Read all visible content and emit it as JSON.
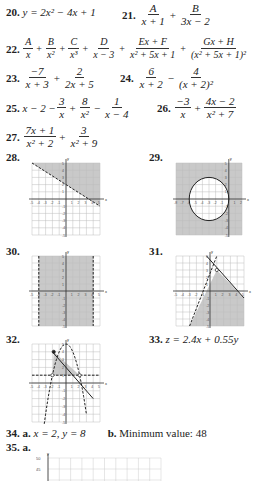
{
  "problems": {
    "p20": {
      "num": "20.",
      "expr": "y = 2x² − 4x + 1"
    },
    "p21": {
      "num": "21.",
      "t1n": "A",
      "t1d": "x + 1",
      "op": "+",
      "t2n": "B",
      "t2d": "3x − 2"
    },
    "p22": {
      "num": "22.",
      "terms": [
        {
          "n": "A",
          "d": "x"
        },
        {
          "n": "B",
          "d": "x²"
        },
        {
          "n": "C",
          "d": "x³"
        },
        {
          "n": "D",
          "d": "x − 3"
        },
        {
          "n": "Ex + F",
          "d": "x² + 5x + 1"
        },
        {
          "n": "Gx + H",
          "d": "(x² + 5x + 1)²"
        }
      ],
      "op": "+"
    },
    "p23": {
      "num": "23.",
      "t1n": "−7",
      "t1d": "x + 3",
      "op": "+",
      "t2n": "2",
      "t2d": "2x + 5"
    },
    "p24": {
      "num": "24.",
      "t1n": "6",
      "t1d": "x + 2",
      "op": "−",
      "t2n": "4",
      "t2d": "(x + 2)²"
    },
    "p25": {
      "num": "25.",
      "lead": "x − 2 −",
      "t1n": "3",
      "t1d": "x",
      "op1": "+",
      "t2n": "8",
      "t2d": "x²",
      "op2": "−",
      "t3n": "1",
      "t3d": "x − 4"
    },
    "p26": {
      "num": "26.",
      "t1n": "−3",
      "t1d": "x",
      "op": "+",
      "t2n": "4x − 2",
      "t2d": "x² + 7"
    },
    "p27": {
      "num": "27.",
      "t1n": "7x + 1",
      "t1d": "x² + 2",
      "op": "+",
      "t2n": "3",
      "t2d": "x² + 9"
    },
    "p28": {
      "num": "28."
    },
    "p29": {
      "num": "29."
    },
    "p30": {
      "num": "30."
    },
    "p31": {
      "num": "31."
    },
    "p32": {
      "num": "32."
    },
    "p33": {
      "num": "33.",
      "expr": "z = 2.4x + 0.55y"
    },
    "p34": {
      "num": "34.",
      "a_label": "a.",
      "a_text": "x = 2, y = 8",
      "b_label": "b.",
      "b_text": "Minimum value: 48"
    },
    "p35": {
      "num": "35.",
      "a_label": "a."
    }
  },
  "chart_data": [
    {
      "id": "graph-28",
      "type": "region",
      "xlim": [
        -5,
        5
      ],
      "ylim": [
        -5,
        5
      ],
      "boundary": [
        {
          "kind": "line",
          "from": [
            -5,
            5
          ],
          "to": [
            5,
            -1
          ],
          "style": "dashed"
        }
      ],
      "shaded": "above line",
      "axis_labels": {
        "x": "x",
        "y": "y"
      },
      "x_ticks": [
        -5,
        -4,
        -3,
        -2,
        -1,
        1,
        2,
        3,
        4,
        5
      ],
      "y_ticks": [
        -5,
        -4,
        -3,
        -2,
        -1,
        1,
        2,
        3,
        4,
        5
      ]
    },
    {
      "id": "graph-29",
      "type": "region",
      "xlim": [
        -8,
        2
      ],
      "ylim": [
        -5,
        5
      ],
      "boundary": [
        {
          "kind": "circle",
          "center": [
            -3,
            0
          ],
          "radius": 3,
          "style": "solid"
        }
      ],
      "shaded": "outside circle",
      "axis_labels": {
        "x": "x",
        "y": "y"
      },
      "x_ticks": [
        -8,
        -7,
        -6,
        -5,
        -4,
        -3,
        -2,
        -1,
        1,
        2
      ],
      "y_ticks": [
        -5,
        -4,
        -3,
        -2,
        -1,
        1,
        2,
        3,
        4,
        5
      ]
    },
    {
      "id": "graph-30",
      "type": "region",
      "xlim": [
        -5,
        5
      ],
      "ylim": [
        -5,
        5
      ],
      "boundary": [
        {
          "kind": "vline",
          "x": -4,
          "style": "dashed"
        },
        {
          "kind": "vline",
          "x": 4,
          "style": "dashed"
        }
      ],
      "shaded": "between lines",
      "axis_labels": {
        "x": "x",
        "y": "y"
      },
      "x_ticks": [
        -5,
        -4,
        -3,
        -2,
        -1,
        1,
        2,
        3,
        4,
        5
      ],
      "y_ticks": [
        -5,
        -4,
        -3,
        -2,
        -1,
        1,
        2,
        3,
        4,
        5
      ]
    },
    {
      "id": "graph-31",
      "type": "region",
      "xlim": [
        -5,
        5
      ],
      "ylim": [
        -5,
        5
      ],
      "boundary": [
        {
          "kind": "line",
          "from": [
            -3,
            -5
          ],
          "to": [
            1,
            5
          ],
          "style": "dashed"
        },
        {
          "kind": "line",
          "from": [
            -0.5,
            5
          ],
          "to": [
            5,
            -1
          ],
          "style": "solid"
        }
      ],
      "vertex": [
        1,
        3
      ],
      "shaded": "below both",
      "axis_labels": {
        "x": "x",
        "y": "y"
      },
      "x_ticks": [
        -5,
        -4,
        -3,
        -2,
        -1,
        1,
        2,
        3,
        4,
        5
      ],
      "y_ticks": [
        -5,
        -4,
        -3,
        -2,
        -1,
        1,
        2,
        3,
        4,
        5
      ]
    },
    {
      "id": "graph-32",
      "type": "region",
      "xlim": [
        -5,
        5
      ],
      "ylim": [
        -5,
        5
      ],
      "boundary": [
        {
          "kind": "hline",
          "y": 1,
          "style": "dashed"
        },
        {
          "kind": "parabola",
          "vertex": [
            0,
            5
          ],
          "a": -1,
          "style": "dashed"
        },
        {
          "kind": "line",
          "from": [
            -2,
            4
          ],
          "to": [
            4,
            -2
          ],
          "style": "solid"
        }
      ],
      "vertices": [
        [
          -1.8,
          4
        ],
        [
          -2,
          1
        ],
        [
          2,
          1
        ]
      ],
      "shaded": "triangle region",
      "axis_labels": {
        "x": "x",
        "y": "y"
      },
      "x_ticks": [
        -5,
        -4,
        -3,
        -2,
        -1,
        1,
        2,
        3,
        4,
        5
      ],
      "y_ticks": [
        -5,
        -4,
        -3,
        -2,
        -1,
        1,
        2,
        3,
        4,
        5
      ]
    },
    {
      "id": "graph-35a",
      "type": "grid",
      "y_ticks": [
        50,
        45
      ],
      "axis_labels": {
        "y": "y"
      }
    }
  ]
}
